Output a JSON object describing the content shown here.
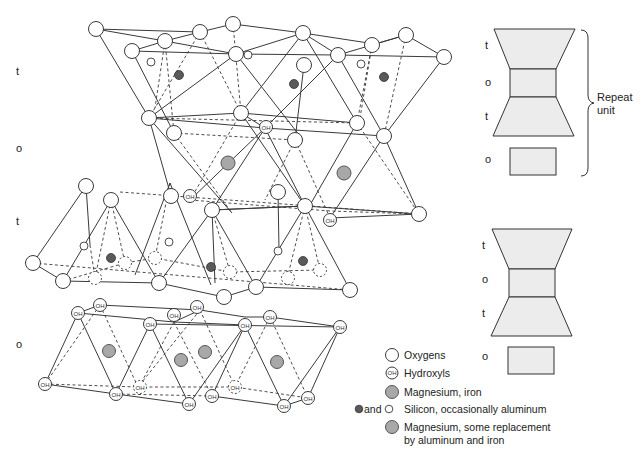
{
  "layer_labels": [
    {
      "text": "t",
      "x": 16,
      "y": 75
    },
    {
      "text": "o",
      "x": 16,
      "y": 152
    },
    {
      "text": "t",
      "x": 16,
      "y": 225
    },
    {
      "text": "o",
      "x": 16,
      "y": 348
    }
  ],
  "schematic": {
    "upper": {
      "labels": [
        {
          "text": "t",
          "x": 485,
          "y": 49
        },
        {
          "text": "o",
          "x": 485,
          "y": 86
        },
        {
          "text": "t",
          "x": 485,
          "y": 120
        },
        {
          "text": "o",
          "x": 485,
          "y": 163
        }
      ],
      "bracket_label_line1": "Repeat",
      "bracket_label_line2": "unit"
    },
    "lower": {
      "labels": [
        {
          "text": "t",
          "x": 482,
          "y": 249
        },
        {
          "text": "o",
          "x": 482,
          "y": 283
        },
        {
          "text": "t",
          "x": 482,
          "y": 317
        },
        {
          "text": "o",
          "x": 482,
          "y": 360
        }
      ]
    }
  },
  "legend": {
    "items": [
      {
        "key": "oxygen",
        "label": "Oxygens"
      },
      {
        "key": "hydroxyl",
        "label": "Hydroxyls",
        "symbol_text": "OH"
      },
      {
        "key": "mg-fe",
        "label": "Magnesium, iron"
      },
      {
        "key": "silicon",
        "prefix": "and",
        "label": "Silicon, occasionally aluminum"
      },
      {
        "key": "mg-al-fe",
        "label_line1": "Magnesium, some replacement",
        "label_line2": "by aluminum and iron"
      }
    ]
  },
  "colors": {
    "line": "#3a3a3a",
    "atom_fill": "#ffffff",
    "mg_fill": "#a8a8a8",
    "si_fill": "#5a5a5a",
    "schematic_fill": "#ececec"
  },
  "oh_text": "OH"
}
